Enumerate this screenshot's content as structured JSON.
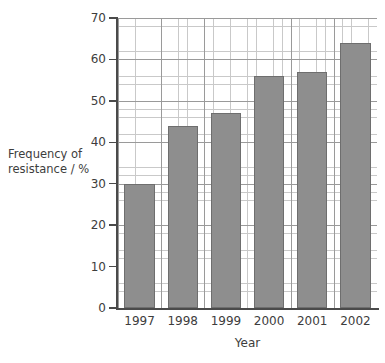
{
  "chart_data": {
    "type": "bar",
    "title": "",
    "xlabel": "Year",
    "ylabel": "Frequency of resistance / %",
    "ylabel_lines": [
      "Frequency of",
      "resistance / %"
    ],
    "categories": [
      "1997",
      "1998",
      "1999",
      "2000",
      "2001",
      "2002"
    ],
    "values": [
      30,
      44,
      47,
      56,
      57,
      64
    ],
    "ylim": [
      0,
      70
    ],
    "ytick_labels": [
      "0",
      "10",
      "20",
      "30",
      "40",
      "50",
      "60",
      "70"
    ],
    "ytick_values": [
      0,
      10,
      20,
      30,
      40,
      50,
      60,
      70
    ],
    "y_major_step": 10,
    "y_minor_step": 2,
    "grid": "major and minor",
    "legend": "none",
    "bar_color": "#8e8e8e",
    "bar_border_color": "#6e6e6e",
    "grid_major_color": "#9a9a9a",
    "grid_minor_color": "#c9c9c9",
    "axis_color": "#4a4a4a",
    "background_color": "#ffffff"
  }
}
